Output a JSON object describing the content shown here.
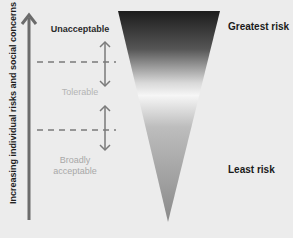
{
  "axis": {
    "label": "Increasing individual risks and social concerns"
  },
  "zones": [
    {
      "label": "Unacceptable",
      "color": "#2a2a2a"
    },
    {
      "label": "Tolerable",
      "color": "#b4b4b4"
    },
    {
      "label": "Broadly",
      "color": "#a8a8a8"
    },
    {
      "label": "acceptable",
      "color": "#a8a8a8"
    }
  ],
  "risk_labels": {
    "top": "Greatest risk",
    "bottom": "Least risk"
  },
  "colors": {
    "background": "#ececec",
    "arrow": "#6b6b6b",
    "triangle_top": "#1a1a1a",
    "triangle_mid": "#f4f4f4",
    "triangle_bottom": "#8a8a8a"
  }
}
